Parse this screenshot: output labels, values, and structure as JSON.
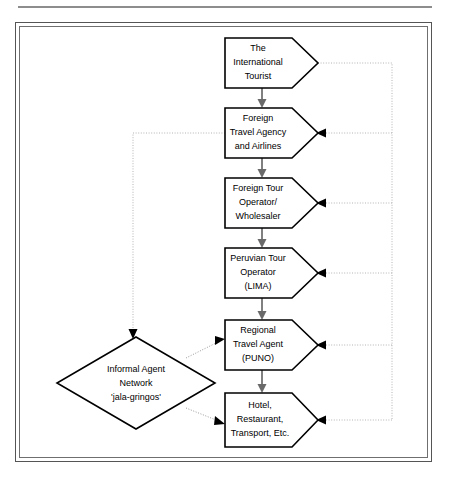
{
  "header": {
    "running_head": ""
  },
  "diagram": {
    "nodes": [
      {
        "id": "n1",
        "shape": "pentagon-arrow",
        "lines": [
          "The",
          "International",
          "Tourist"
        ],
        "x": 225,
        "y": 38,
        "w": 90,
        "h": 50
      },
      {
        "id": "n2",
        "shape": "pentagon-arrow",
        "lines": [
          "Foreign",
          "Travel Agency",
          "and Airlines"
        ],
        "x": 225,
        "y": 108,
        "w": 90,
        "h": 50
      },
      {
        "id": "n3",
        "shape": "pentagon-arrow",
        "lines": [
          "Foreign Tour",
          "Operator/",
          "Wholesaler"
        ],
        "x": 225,
        "y": 178,
        "w": 90,
        "h": 50
      },
      {
        "id": "n4",
        "shape": "pentagon-arrow",
        "lines": [
          "Peruvian Tour",
          "Operator",
          "(LIMA)"
        ],
        "x": 225,
        "y": 248,
        "w": 90,
        "h": 50
      },
      {
        "id": "n5",
        "shape": "pentagon-arrow",
        "lines": [
          "Regional",
          "Travel Agent",
          "(PUNO)"
        ],
        "x": 225,
        "y": 320,
        "w": 90,
        "h": 50
      },
      {
        "id": "n6",
        "shape": "pentagon-arrow",
        "lines": [
          "Hotel,",
          "Restaurant,",
          "Transport, Etc."
        ],
        "x": 225,
        "y": 393,
        "w": 90,
        "h": 50
      },
      {
        "id": "d1",
        "shape": "diamond",
        "lines": [
          "Informal Agent",
          "Network",
          "'jala-gringos'"
        ],
        "cx": 136,
        "cy": 383,
        "rx": 79,
        "ry": 46
      }
    ],
    "edges": [
      {
        "from": "n1",
        "to": "n2",
        "style": "solid",
        "direction": "down"
      },
      {
        "from": "n2",
        "to": "n3",
        "style": "solid",
        "direction": "down"
      },
      {
        "from": "n3",
        "to": "n4",
        "style": "solid",
        "direction": "down"
      },
      {
        "from": "n4",
        "to": "n5",
        "style": "solid",
        "direction": "down"
      },
      {
        "from": "n5",
        "to": "n6",
        "style": "solid",
        "direction": "down"
      },
      {
        "from": "n1",
        "to": "n2",
        "style": "dotted",
        "direction": "right-trunk"
      },
      {
        "from": "n1",
        "to": "n3",
        "style": "dotted",
        "direction": "right-trunk"
      },
      {
        "from": "n1",
        "to": "n4",
        "style": "dotted",
        "direction": "right-trunk"
      },
      {
        "from": "n1",
        "to": "n5",
        "style": "dotted",
        "direction": "right-trunk"
      },
      {
        "from": "n1",
        "to": "n6",
        "style": "dotted",
        "direction": "right-trunk"
      },
      {
        "from": "n2",
        "to": "d1",
        "style": "dotted",
        "direction": "left-down"
      },
      {
        "from": "d1",
        "to": "n5",
        "style": "dotted",
        "direction": "up-right"
      },
      {
        "from": "d1",
        "to": "n6",
        "style": "dotted",
        "direction": "down-right"
      }
    ],
    "colors": {
      "node_stroke": "#000000",
      "node_fill": "#ffffff",
      "solid_connector": "#6a6a6a",
      "dotted_connector": "#b4b4b4",
      "frame": "#555555",
      "page_background": "#ffffff"
    }
  }
}
